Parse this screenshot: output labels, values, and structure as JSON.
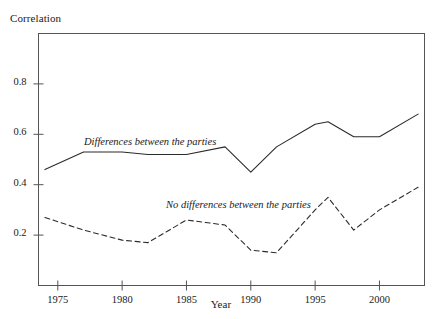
{
  "chart_data": {
    "type": "line",
    "title": "",
    "xlabel": "Year",
    "ylabel": "Correlation",
    "xlim": [
      1973.5,
      2003.5
    ],
    "ylim": [
      0.0,
      1.0
    ],
    "grid": false,
    "legend_position": "inline-annotations",
    "xticks": [
      1975,
      1980,
      1985,
      1990,
      1995,
      2000
    ],
    "xtick_labels": [
      "1975",
      "1980",
      "1985",
      "1990",
      "1995",
      "2000"
    ],
    "yticks": [
      0.2,
      0.4,
      0.6,
      0.8
    ],
    "ytick_labels": [
      "0.2",
      "0.4",
      "0.6",
      "0.8"
    ],
    "series": [
      {
        "name": "Differences between the parties",
        "style": "solid",
        "color": "#2b2b2b",
        "x": [
          1974,
          1977,
          1980,
          1982,
          1985,
          1988,
          1990,
          1992,
          1995,
          1996,
          1998,
          2000,
          2003
        ],
        "values": [
          0.46,
          0.53,
          0.53,
          0.52,
          0.52,
          0.55,
          0.45,
          0.55,
          0.64,
          0.65,
          0.59,
          0.59,
          0.68
        ]
      },
      {
        "name": "No differences between the parties",
        "style": "dashed",
        "color": "#2b2b2b",
        "x": [
          1974,
          1977,
          1980,
          1982,
          1985,
          1988,
          1990,
          1992,
          1995,
          1996,
          1998,
          2000,
          2003
        ],
        "values": [
          0.27,
          0.22,
          0.18,
          0.17,
          0.26,
          0.24,
          0.14,
          0.13,
          0.3,
          0.35,
          0.22,
          0.3,
          0.39
        ]
      }
    ]
  },
  "annotations": {
    "series_one_label": "Differences between the parties",
    "series_two_label": "No differences between the parties"
  },
  "axes": {
    "y_title": "Correlation",
    "x_title": "Year"
  },
  "colors": {
    "frame": "#555555",
    "line": "#2b2b2b",
    "text": "#1a1a1a",
    "background": "#ffffff"
  }
}
